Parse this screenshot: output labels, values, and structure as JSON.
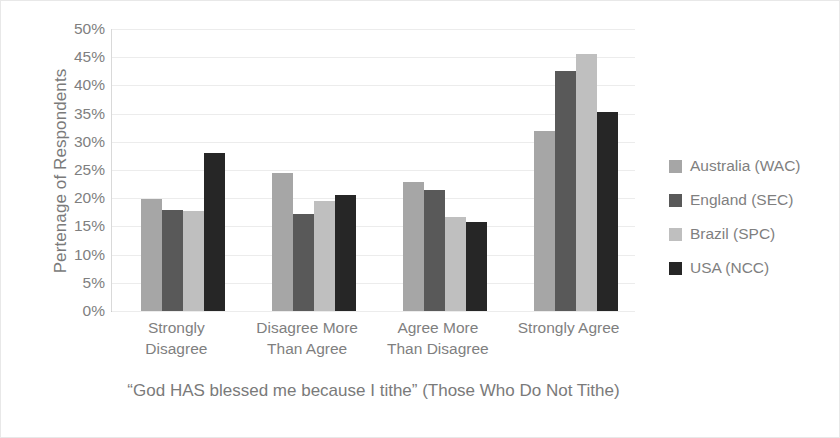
{
  "chart_data": {
    "type": "bar",
    "title": "",
    "subtitle": "",
    "xlabel": "“God HAS blessed me because I tithe” (Those Who Do Not Tithe)",
    "ylabel": "Pertenage of Respondents",
    "categories": [
      "Strongly Disagree",
      "Disagree More Than Agree",
      "Agree More Than Disagree",
      "Strongly Agree"
    ],
    "category_lines": [
      [
        "Strongly",
        "Disagree"
      ],
      [
        "Disagree More",
        "Than Agree"
      ],
      [
        "Agree More",
        "Than Disagree"
      ],
      [
        "Strongly Agree",
        ""
      ]
    ],
    "series": [
      {
        "name": "Australia (WAC)",
        "color": "#a6a6a6",
        "values": [
          19.8,
          24.5,
          22.8,
          32.0
        ]
      },
      {
        "name": "England (SEC)",
        "color": "#595959",
        "values": [
          17.9,
          17.2,
          21.5,
          42.5
        ]
      },
      {
        "name": "Brazil (SPC)",
        "color": "#bfbfbf",
        "values": [
          17.8,
          19.5,
          16.7,
          45.5
        ]
      },
      {
        "name": "USA (NCC)",
        "color": "#262626",
        "values": [
          28.0,
          20.5,
          15.7,
          35.3
        ]
      }
    ],
    "ylim": [
      0,
      50
    ],
    "ytick_values": [
      0,
      5,
      10,
      15,
      20,
      25,
      30,
      35,
      40,
      45,
      50
    ],
    "ytick_labels": [
      "0%",
      "5%",
      "10%",
      "15%",
      "20%",
      "25%",
      "30%",
      "35%",
      "40%",
      "45%",
      "50%"
    ],
    "grid": true,
    "grid_axis": "y",
    "legend_position": "right",
    "value_suffix": "%"
  }
}
